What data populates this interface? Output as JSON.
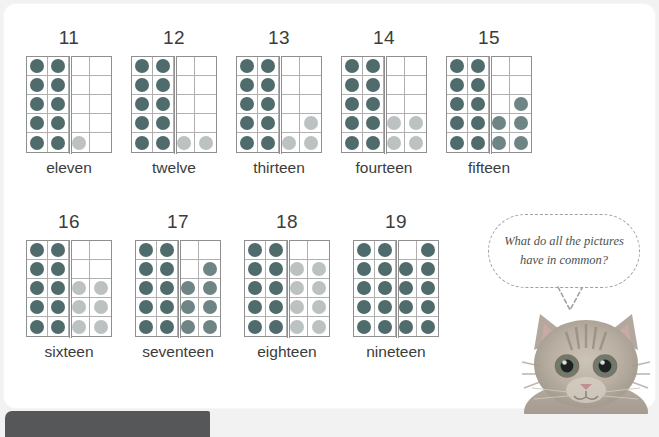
{
  "page": {
    "background_color": "#f2f2f2",
    "card_color": "#ffffff"
  },
  "colors": {
    "dot_dark": "#4f6b6b",
    "dot_light": "#bcc2c2",
    "dot_mid": "#6f8585",
    "grid_border": "#8f8f8f",
    "grid_line": "#b0b0b0",
    "text": "#3c3c3c",
    "bubble_text": "#4a5252",
    "bubble_outline": "#9aa3a3",
    "bottom_bar": "#555759"
  },
  "grid_spec": {
    "columns": 4,
    "rows": 5,
    "base_ten_columns": 2,
    "note": "left two columns always full (ten); extra dots fill remaining two columns"
  },
  "rows": [
    {
      "row_index": 1,
      "items": [
        {
          "number": "11",
          "word": "eleven",
          "total_dots": 11,
          "base_dots": 10,
          "extra_dots": 1,
          "cells": [
            [
              "dark",
              "dark",
              "empty",
              "empty"
            ],
            [
              "dark",
              "dark",
              "empty",
              "empty"
            ],
            [
              "dark",
              "dark",
              "empty",
              "empty"
            ],
            [
              "dark",
              "dark",
              "empty",
              "empty"
            ],
            [
              "dark",
              "dark",
              "light",
              "empty"
            ]
          ]
        },
        {
          "number": "12",
          "word": "twelve",
          "total_dots": 12,
          "base_dots": 10,
          "extra_dots": 2,
          "cells": [
            [
              "dark",
              "dark",
              "empty",
              "empty"
            ],
            [
              "dark",
              "dark",
              "empty",
              "empty"
            ],
            [
              "dark",
              "dark",
              "empty",
              "empty"
            ],
            [
              "dark",
              "dark",
              "empty",
              "empty"
            ],
            [
              "dark",
              "dark",
              "light",
              "light"
            ]
          ]
        },
        {
          "number": "13",
          "word": "thirteen",
          "total_dots": 13,
          "base_dots": 10,
          "extra_dots": 3,
          "cells": [
            [
              "dark",
              "dark",
              "empty",
              "empty"
            ],
            [
              "dark",
              "dark",
              "empty",
              "empty"
            ],
            [
              "dark",
              "dark",
              "empty",
              "empty"
            ],
            [
              "dark",
              "dark",
              "empty",
              "light"
            ],
            [
              "dark",
              "dark",
              "light",
              "light"
            ]
          ]
        },
        {
          "number": "14",
          "word": "fourteen",
          "total_dots": 14,
          "base_dots": 10,
          "extra_dots": 4,
          "cells": [
            [
              "dark",
              "dark",
              "empty",
              "empty"
            ],
            [
              "dark",
              "dark",
              "empty",
              "empty"
            ],
            [
              "dark",
              "dark",
              "empty",
              "empty"
            ],
            [
              "dark",
              "dark",
              "light",
              "light"
            ],
            [
              "dark",
              "dark",
              "light",
              "light"
            ]
          ]
        },
        {
          "number": "15",
          "word": "fifteen",
          "total_dots": 15,
          "base_dots": 10,
          "extra_dots": 5,
          "cells": [
            [
              "dark",
              "dark",
              "empty",
              "empty"
            ],
            [
              "dark",
              "dark",
              "empty",
              "empty"
            ],
            [
              "dark",
              "dark",
              "empty",
              "mid"
            ],
            [
              "dark",
              "dark",
              "mid",
              "mid"
            ],
            [
              "dark",
              "dark",
              "mid",
              "mid"
            ]
          ]
        }
      ]
    },
    {
      "row_index": 2,
      "items": [
        {
          "number": "16",
          "word": "sixteen",
          "total_dots": 16,
          "base_dots": 10,
          "extra_dots": 6,
          "cells": [
            [
              "dark",
              "dark",
              "empty",
              "empty"
            ],
            [
              "dark",
              "dark",
              "empty",
              "empty"
            ],
            [
              "dark",
              "dark",
              "light",
              "light"
            ],
            [
              "dark",
              "dark",
              "light",
              "light"
            ],
            [
              "dark",
              "dark",
              "light",
              "light"
            ]
          ]
        },
        {
          "number": "17",
          "word": "seventeen",
          "total_dots": 17,
          "base_dots": 10,
          "extra_dots": 7,
          "cells": [
            [
              "dark",
              "dark",
              "empty",
              "empty"
            ],
            [
              "dark",
              "dark",
              "empty",
              "mid"
            ],
            [
              "dark",
              "dark",
              "mid",
              "mid"
            ],
            [
              "dark",
              "dark",
              "mid",
              "mid"
            ],
            [
              "dark",
              "dark",
              "mid",
              "mid"
            ]
          ]
        },
        {
          "number": "18",
          "word": "eighteen",
          "total_dots": 18,
          "base_dots": 10,
          "extra_dots": 8,
          "cells": [
            [
              "dark",
              "dark",
              "empty",
              "empty"
            ],
            [
              "dark",
              "dark",
              "light",
              "light"
            ],
            [
              "dark",
              "dark",
              "light",
              "light"
            ],
            [
              "dark",
              "dark",
              "light",
              "light"
            ],
            [
              "dark",
              "dark",
              "light",
              "light"
            ]
          ]
        },
        {
          "number": "19",
          "word": "nineteen",
          "total_dots": 19,
          "base_dots": 10,
          "extra_dots": 9,
          "cells": [
            [
              "dark",
              "dark",
              "empty",
              "dark"
            ],
            [
              "dark",
              "dark",
              "dark",
              "dark"
            ],
            [
              "dark",
              "dark",
              "dark",
              "dark"
            ],
            [
              "dark",
              "dark",
              "dark",
              "dark"
            ],
            [
              "dark",
              "dark",
              "dark",
              "dark"
            ]
          ]
        }
      ]
    }
  ],
  "speech_bubble": {
    "text": "What do all the pictures have in common?"
  },
  "kitten": {
    "alt": "tabby kitten photo"
  },
  "bottom_bar": {
    "label": ""
  }
}
